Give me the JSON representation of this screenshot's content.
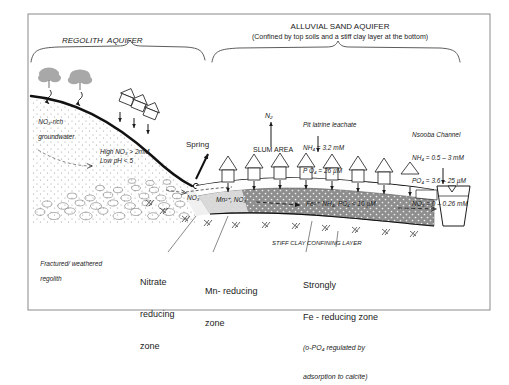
{
  "figure": {
    "title_regolith": "REGOLITH  AQUIFER",
    "title_alluvial": "ALLUVIAL SAND AQUIFER",
    "title_alluvial_sub": "(Confined by top soils and a stiff clay layer at the bottom)"
  },
  "labels": {
    "no3_rich_line1": "NO₃-rich",
    "no3_rich_line2": "groundwater",
    "high_no3": "High NO₃ > 2mM",
    "low_ph": "Low pH < 5",
    "spring": "Spring",
    "n2": "N₂",
    "slum_area": "SLUM AREA",
    "no3_plume": "NO₃",
    "mn_no3": "Mn²⁺, NO₃",
    "fe_zone": "Fe²⁺, NH₄, PO₄ < 10 µM",
    "stiff_clay": "STIFF CLAY CONFINING LAYER",
    "fractured_line1": "Fractured/ weathered",
    "fractured_line2": "regolith"
  },
  "callouts": {
    "pit_latrine": {
      "title": "Pit latrine leachate",
      "lines": [
        "NH₄ = 3.2 mM",
        "P O₄ = 26 µM"
      ]
    },
    "nsooba": {
      "title": "Nsooba Channel",
      "lines": [
        "NH₄ = 0.5 – 3 mM",
        "PO₄ = 3.6 – 25 µM",
        "NO₃ = 0 – 0.26 mM"
      ]
    }
  },
  "zones": {
    "nitrate": [
      "Nitrate",
      "reducing",
      "zone"
    ],
    "manganese": [
      "Mn- reducing",
      "zone"
    ],
    "iron": {
      "line1": "Strongly",
      "line2": "Fe - reducing zone",
      "note1": "(o-PO₄ regulated by",
      "note2": "adsorption to calcite)"
    }
  },
  "colors": {
    "ink": "#1b1b1b",
    "frame": "#8a8a8a",
    "aquifer_fill": "#8e8e8e",
    "vadose_fill": "#e8e8e8",
    "tree_fill": "#a8a8a8",
    "mn_fill": "#d8d8d8"
  }
}
